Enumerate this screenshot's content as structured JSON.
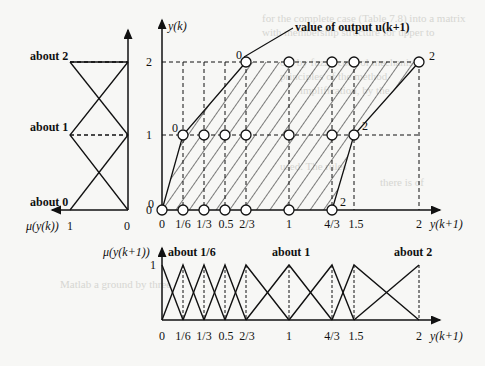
{
  "diagram": {
    "annotation": "value of output u(k+1)",
    "main_plot": {
      "y_axis_label": "y(k)",
      "x_axis_label": "y(k+1)",
      "y_ticks": [
        "0",
        "1",
        "2"
      ],
      "x_ticks": [
        "0",
        "1/6",
        "1/3",
        "0.5",
        "2/3",
        "1",
        "4/3",
        "1.5",
        "2"
      ],
      "point_labels": {
        "p_0_0": "0",
        "p_1_0": "0",
        "p_2_0": "0",
        "p_1_2": "2",
        "p_0_2": "2",
        "p_2_2": "2"
      }
    },
    "left_plot": {
      "x_axis_label": "μ(y(k))",
      "x_ticks": [
        "1",
        "0"
      ],
      "fuzzy_sets": [
        "about 2",
        "about 1",
        "about 0"
      ]
    },
    "bottom_plot": {
      "y_axis_label": "μ(y(k+1))",
      "y_tick": "1",
      "x_axis_label": "y(k+1)",
      "x_ticks": [
        "0",
        "1/6",
        "1/3",
        "0.5",
        "2/3",
        "1",
        "4/3",
        "1.5",
        "2"
      ],
      "fuzzy_sets": [
        "about 1/6",
        "about 1",
        "about 2"
      ]
    }
  }
}
